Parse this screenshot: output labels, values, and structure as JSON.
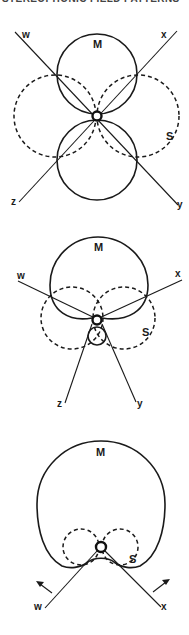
{
  "header": {
    "text": "STEREOPHONIC FIELD PATTERNS"
  },
  "diagrams": [
    {
      "id": "figure-1",
      "description": "M (solid figure-eight, vertical) and S (dashed figure-eight, horizontal) patterns with four axes",
      "labels": {
        "mid": "M",
        "side": "S",
        "axis_w": "w",
        "axis_x": "x",
        "axis_y": "y",
        "axis_z": "z"
      }
    },
    {
      "id": "figure-2",
      "description": "M as hypercardioid (large front lobe, small rear lobe) with dashed S figure-eight; axes w, x, y, z",
      "labels": {
        "mid": "M",
        "side": "S",
        "axis_w": "w",
        "axis_x": "x",
        "axis_y": "y",
        "axis_z": "z"
      }
    },
    {
      "id": "figure-3",
      "description": "M as large omni/cardioid pattern with small dashed S figure-eight; axes w and x with outward arrows",
      "labels": {
        "mid": "M",
        "side": "S",
        "axis_w": "w",
        "axis_x": "x"
      }
    }
  ]
}
